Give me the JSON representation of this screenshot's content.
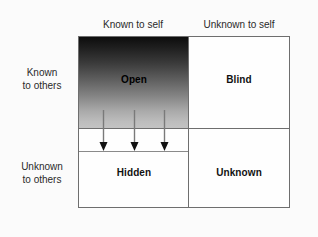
{
  "figure": {
    "type": "2x2-matrix-diagram"
  },
  "columns": [
    {
      "id": "known-self",
      "label": "Known to self"
    },
    {
      "id": "unknown-self",
      "label": "Unknown to self"
    }
  ],
  "rows": [
    {
      "id": "known-others",
      "label_line1": "Known",
      "label_line2": "to others"
    },
    {
      "id": "unknown-others",
      "label_line1": "Unknown",
      "label_line2": "to others"
    }
  ],
  "quadrants": [
    {
      "id": "open",
      "label": "Open",
      "row": "known-others",
      "column": "known-self",
      "fill": "gradient-dark-to-light"
    },
    {
      "id": "blind",
      "label": "Blind",
      "row": "known-others",
      "column": "unknown-self",
      "fill": "#fefefe"
    },
    {
      "id": "hidden",
      "label": "Hidden",
      "row": "unknown-others",
      "column": "known-self",
      "fill": "#fefefe"
    },
    {
      "id": "unknown",
      "label": "Unknown",
      "row": "unknown-others",
      "column": "unknown-self",
      "fill": "#fefefe"
    }
  ],
  "arrows": {
    "count": 3,
    "direction": "down",
    "from_quadrant": "open",
    "to_quadrant": "hidden",
    "color": "#7a7a7a",
    "head_color": "#111111"
  },
  "colors": {
    "background": "#fbfbfb",
    "border": "#6e6e6e",
    "divider": "#6e6e6e",
    "sub_divider": "#8a8a8a",
    "text": "#2a2a2a",
    "label_text": "#111111",
    "gradient_top": "#0d0d0d",
    "gradient_bottom": "#c4c4c4"
  }
}
